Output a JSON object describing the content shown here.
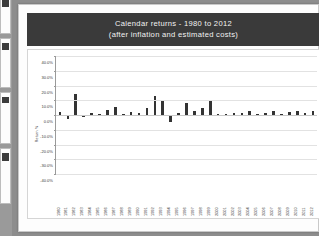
{
  "document": {
    "thumbnail_strip": [
      {
        "name": "thumbnail-page-1"
      },
      {
        "name": "thumbnail-page-2"
      },
      {
        "name": "thumbnail-page-3"
      },
      {
        "name": "thumbnail-page-4"
      }
    ]
  },
  "chart_data": {
    "type": "bar",
    "title": "Calendar returns - 1980 to 2012",
    "subtitle": "(after inflation and estimated costs)",
    "xlabel": "",
    "ylabel": "Return %",
    "ylim": [
      -40,
      40
    ],
    "ytick_labels": [
      "40.0%",
      "30.0%",
      "20.0%",
      "10.0%",
      "0.0%",
      "-10.0%",
      "-20.0%",
      "-30.0%",
      "-40.0%"
    ],
    "ytick_values": [
      40,
      30,
      20,
      10,
      0,
      -10,
      -20,
      -30,
      -40
    ],
    "grid": true,
    "legend": "none",
    "bar_color": "#333333",
    "categories": [
      "1980",
      "1981",
      "1982",
      "1983",
      "1984",
      "1985",
      "1986",
      "1987",
      "1988",
      "1989",
      "1990",
      "1991",
      "1992",
      "1993",
      "1994",
      "1995",
      "1996",
      "1997",
      "1998",
      "1999",
      "2000",
      "2001",
      "2002",
      "2003",
      "2004",
      "2005",
      "2006",
      "2007",
      "2008",
      "2009",
      "2010",
      "2011",
      "2012"
    ],
    "values": [
      1.8,
      -2.8,
      14.0,
      -1.2,
      1.2,
      0.8,
      3.2,
      5.6,
      1.0,
      2.2,
      1.6,
      4.6,
      13.0,
      10.0,
      -5.0,
      1.2,
      8.2,
      3.0,
      4.8,
      10.4,
      0.9,
      1.0,
      1.6,
      1.2,
      2.4,
      1.0,
      1.4,
      2.6,
      0.4,
      2.2,
      2.8,
      1.6,
      2.6
    ]
  },
  "title_band": {
    "line1": "Calendar returns - 1980 to 2012",
    "line2": "(after inflation and estimated costs)",
    "background": "#3a3a3a",
    "text_color": "#f2f2f2"
  }
}
